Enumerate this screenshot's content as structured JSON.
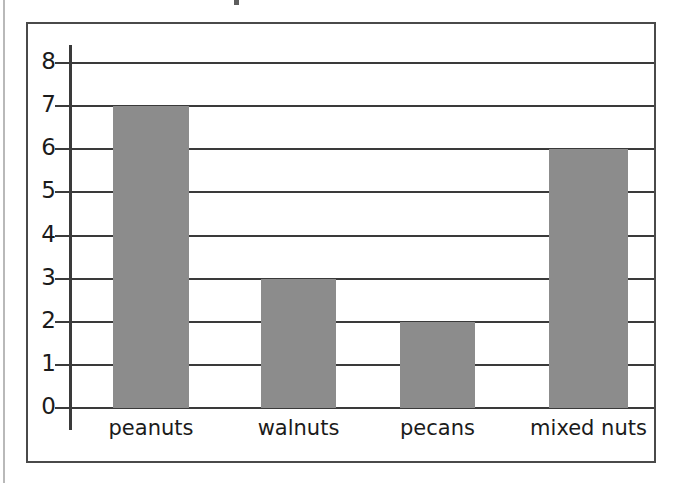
{
  "chart_data": {
    "type": "bar",
    "title": "",
    "xlabel": "",
    "ylabel": "",
    "categories": [
      "peanuts",
      "walnuts",
      "pecans",
      "mixed nuts"
    ],
    "values": [
      7,
      3,
      2,
      6
    ],
    "ylim": [
      0,
      8
    ],
    "ytick_labels": [
      "0",
      "1",
      "2",
      "3",
      "4",
      "5",
      "6",
      "7",
      "8"
    ],
    "ytick_values": [
      0,
      1,
      2,
      3,
      4,
      5,
      6,
      7,
      8
    ],
    "grid": true,
    "legend": null,
    "bar_color": "#8c8c8c",
    "axis_color": "#3a3a3a",
    "frame_color": "#4a4a4a",
    "background_color": "#ffffff"
  }
}
